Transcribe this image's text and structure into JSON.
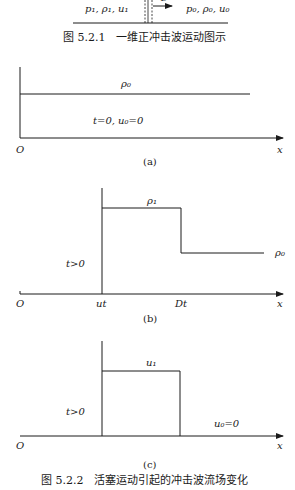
{
  "figure_521": {
    "left_state": "p₁, ρ₁, u₁",
    "right_state": "p₀, ρ₀, u₀",
    "shock_arrow_label": "D",
    "caption": "图 5.2.1　一维正冲击波运动图示"
  },
  "panel_a": {
    "density_label": "ρ₀",
    "condition": "t=0, u₀=0",
    "origin": "O",
    "axis": "x",
    "tag": "(a)"
  },
  "panel_b": {
    "high_density_label": "ρ₁",
    "low_density_label": "ρ₀",
    "condition": "t>0",
    "origin": "O",
    "piston_pos": "ut",
    "shock_pos": "Dt",
    "axis": "x",
    "tag": "(b)"
  },
  "panel_c": {
    "velocity_label": "u₁",
    "condition": "t>0",
    "rest_label": "u₀=0",
    "origin": "O",
    "axis": "x",
    "tag": "(c)"
  },
  "figure_522": {
    "caption": "图 5.2.2　活塞运动引起的冲击波流场变化"
  }
}
